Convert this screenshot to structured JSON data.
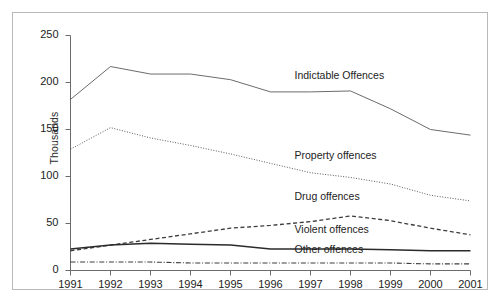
{
  "chart": {
    "ylabel": "Thousands",
    "title": "",
    "xlabel": ""
  },
  "chart_data": {
    "type": "line",
    "title": "",
    "xlabel": "",
    "ylabel": "Thousands",
    "x": [
      1991,
      1992,
      1993,
      1994,
      1995,
      1996,
      1997,
      1998,
      1999,
      2000,
      2001
    ],
    "xticklabels": [
      "1991",
      "1992",
      "1993",
      "1994",
      "1995",
      "1996",
      "1997",
      "1998",
      "1999",
      "2000",
      "2001"
    ],
    "yticks": [
      0,
      50,
      100,
      150,
      200,
      250
    ],
    "yticklabels": [
      "0",
      "50",
      "100",
      "150",
      "200",
      "250"
    ],
    "ylim": [
      0,
      250
    ],
    "xlim": [
      1991,
      2001
    ],
    "grid": false,
    "legend": "inline-annotations",
    "series": [
      {
        "name": "Indictable Offences",
        "linestyle": "solid",
        "color": "#5a5a5a",
        "values": [
          182,
          217,
          209,
          209,
          203,
          190,
          190,
          191,
          172,
          150,
          144
        ]
      },
      {
        "name": "Property offences",
        "linestyle": "dotted",
        "color": "#5a5a5a",
        "values": [
          129,
          152,
          141,
          133,
          124,
          114,
          104,
          99,
          92,
          80,
          74
        ]
      },
      {
        "name": "Drug offences",
        "linestyle": "dashed",
        "color": "#3c3c3c",
        "values": [
          21,
          27,
          33,
          39,
          45,
          48,
          52,
          58,
          53,
          45,
          38
        ]
      },
      {
        "name": "Violent offences",
        "linestyle": "solid",
        "color": "#2b2b2b",
        "values": [
          23,
          27,
          29,
          28,
          27,
          23,
          23,
          23,
          22,
          21,
          21
        ]
      },
      {
        "name": "Other offences",
        "linestyle": "dashdot",
        "color": "#3c3c3c",
        "values": [
          9,
          9,
          9,
          8,
          8,
          8,
          8,
          8,
          8,
          7,
          7
        ]
      }
    ],
    "annotations": [
      {
        "text": "Indictable Offences",
        "x": 1996.6,
        "y": 207
      },
      {
        "text": "Property offences",
        "x": 1996.6,
        "y": 122
      },
      {
        "text": "Drug offences",
        "x": 1996.6,
        "y": 78
      },
      {
        "text": "Violent offences",
        "x": 1996.6,
        "y": 43
      },
      {
        "text": "Other offences",
        "x": 1996.6,
        "y": 22
      }
    ]
  }
}
